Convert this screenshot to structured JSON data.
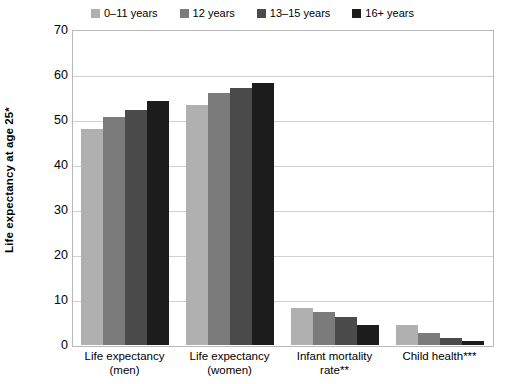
{
  "chart_data": {
    "type": "bar",
    "title": "",
    "subtitle": "",
    "xlabel": "",
    "ylabel": "Life expectancy at age 25*",
    "ylim": [
      0,
      70
    ],
    "yticks": [
      0,
      10,
      20,
      30,
      40,
      50,
      60,
      70
    ],
    "ytick_labels": [
      "0",
      "10",
      "20",
      "30",
      "40",
      "50",
      "60",
      "70"
    ],
    "grid": true,
    "legend_position": "top-center",
    "categories": [
      "Life expectancy (men)",
      "Life expectancy (women)",
      "Infant mortality rate**",
      "Child health***"
    ],
    "category_lines": [
      [
        "Life expectancy",
        "(men)"
      ],
      [
        "Life expectancy",
        "(women)"
      ],
      [
        "Infant mortality",
        "rate**"
      ],
      [
        "Child health***"
      ]
    ],
    "series": [
      {
        "name": "0–11 years",
        "color": "#b0b0b0",
        "values": [
          48.0,
          53.3,
          8.3,
          4.5
        ]
      },
      {
        "name": "12 years",
        "color": "#7b7b7b",
        "values": [
          50.7,
          56.0,
          7.4,
          2.6
        ]
      },
      {
        "name": "13–15 years",
        "color": "#4b4b4b",
        "values": [
          52.2,
          57.1,
          6.2,
          1.6
        ]
      },
      {
        "name": "16+ years",
        "color": "#1c1c1c",
        "values": [
          54.2,
          58.2,
          4.5,
          0.8
        ]
      }
    ]
  },
  "legend": {
    "items": [
      {
        "label": "0–11 years",
        "color": "#b0b0b0"
      },
      {
        "label": "12 years",
        "color": "#7b7b7b"
      },
      {
        "label": "13–15 years",
        "color": "#4b4b4b"
      },
      {
        "label": "16+ years",
        "color": "#1c1c1c"
      }
    ]
  },
  "axes": {
    "y_title": "Life expectancy at age 25*",
    "y_tick_labels": [
      "70",
      "60",
      "50",
      "40",
      "30",
      "20",
      "10",
      "0"
    ]
  },
  "colors": {
    "plot_border": "#b9b9b9",
    "gridline": "#d0d0d0",
    "background": "#ffffff",
    "text": "#000000"
  }
}
